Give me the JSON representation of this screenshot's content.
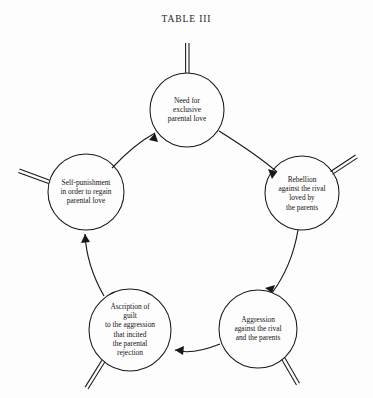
{
  "figure": {
    "title": "TABLE III",
    "type": "cycle-diagram",
    "background_color": "#fdfdfd",
    "line_color": "#181818",
    "direction": "clockwise"
  },
  "nodes": [
    {
      "id": "need-for-exclusive-parental-love",
      "label": "Need for\nexclusive\nparental love",
      "position": "top",
      "cx": 187,
      "cy": 110,
      "r": 37,
      "tick_angle_deg": -90
    },
    {
      "id": "rebellion-against-the-rival",
      "label": "Rebellion\nagainst the rival\nloved by\nthe parents",
      "position": "right",
      "cx": 302,
      "cy": 193,
      "r": 37,
      "tick_angle_deg": -38
    },
    {
      "id": "aggression-against-the-rival",
      "label": "Aggression\nagainst the rival\nand the parents",
      "position": "bottom-right",
      "cx": 258,
      "cy": 329,
      "r": 39,
      "tick_angle_deg": 52
    },
    {
      "id": "ascription-of-guilt",
      "label": "Ascription of\nguilt\nto the aggression\nthat incited\nthe parental\nrejection",
      "position": "bottom-left",
      "cx": 130,
      "cy": 330,
      "r": 41,
      "tick_angle_deg": 128
    },
    {
      "id": "self-punishment",
      "label": "Self-punishment\nin order to regain\nparental love",
      "position": "left",
      "cx": 86,
      "cy": 192,
      "r": 38,
      "tick_angle_deg": 198
    }
  ],
  "edges": [
    {
      "id": "edge-need-to-rebellion",
      "from": "need-for-exclusive-parental-love",
      "to": "rebellion-against-the-rival",
      "arrow": "to"
    },
    {
      "id": "edge-rebellion-to-aggression",
      "from": "rebellion-against-the-rival",
      "to": "aggression-against-the-rival",
      "arrow": "to"
    },
    {
      "id": "edge-aggression-to-ascription",
      "from": "aggression-against-the-rival",
      "to": "ascription-of-guilt",
      "arrow": "to"
    },
    {
      "id": "edge-ascription-to-selfpunishment",
      "from": "ascription-of-guilt",
      "to": "self-punishment",
      "arrow": "to"
    },
    {
      "id": "edge-selfpunishment-to-need",
      "from": "self-punishment",
      "to": "need-for-exclusive-parental-love",
      "arrow": "to"
    }
  ]
}
